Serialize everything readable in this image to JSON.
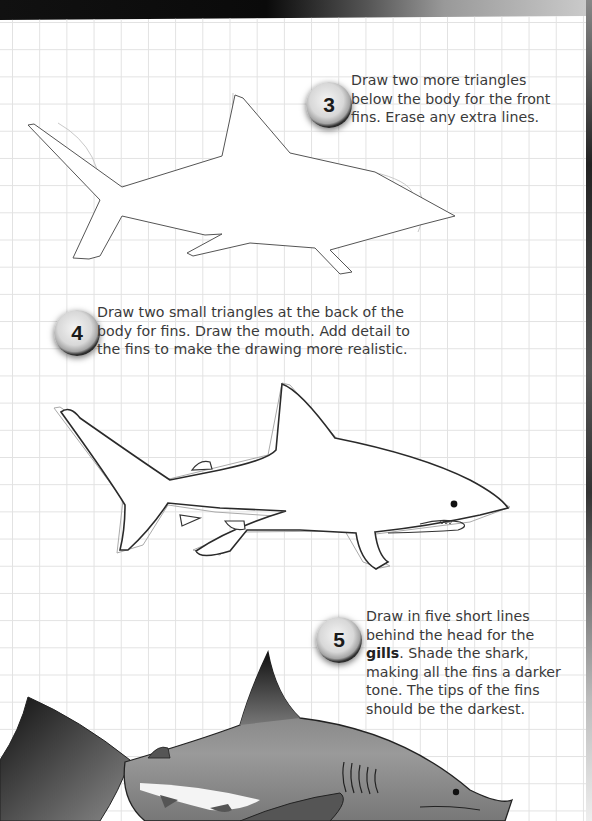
{
  "page": {
    "theme_colors": {
      "grid": "#e2e2e2",
      "text": "#3a3a3a",
      "badge_ring": "#111111"
    }
  },
  "steps": [
    {
      "number": "3",
      "text": "Draw two more triangles below the body for the front fins. Erase any extra lines.",
      "lines": [
        "Draw two more triangles",
        "below the body for the front",
        "fins. Erase any extra lines."
      ]
    },
    {
      "number": "4",
      "text": "Draw two small triangles at the back of the body for fins. Draw the mouth. Add detail to the fins to make the drawing more realistic.",
      "lines": [
        "Draw two small triangles at the back of the",
        "body for fins. Draw the mouth. Add detail to",
        "the fins to make the drawing more realistic."
      ]
    },
    {
      "number": "5",
      "text_before_bold": "Draw in five short lines behind the head for the",
      "bold_term": "gills",
      "text_after_bold": ". Shade the shark, making all the fins a darker tone. The tips of the fins should be the darkest.",
      "lines": [
        "Draw in five short lines",
        "behind the head for the",
        "gills",
        ". Shade the shark,",
        "making all the fins a darker",
        "tone. The tips of the fins",
        "should be the darkest."
      ]
    }
  ],
  "illustrations": [
    {
      "name": "shark-outline-step-3",
      "style": "light pencil outline with construction oval"
    },
    {
      "name": "shark-outline-step-4",
      "style": "inked outline with mouth and small fins"
    },
    {
      "name": "shark-shaded-step-5",
      "style": "shaded grayscale with gills"
    }
  ]
}
